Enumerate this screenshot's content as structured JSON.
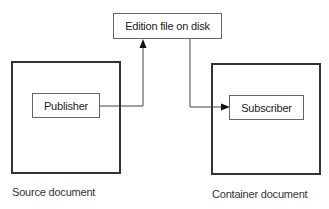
{
  "diagram": {
    "type": "publish-subscribe flow",
    "nodes": {
      "edition": {
        "label": "Edition file on disk"
      },
      "publisher": {
        "label": "Publisher"
      },
      "subscriber": {
        "label": "Subscriber"
      },
      "source_document": {
        "label": "Source document"
      },
      "container_document": {
        "label": "Container document"
      }
    },
    "edges": [
      {
        "from": "Publisher",
        "to": "Edition file on disk",
        "arrow": "end"
      },
      {
        "from": "Edition file on disk",
        "to": "Subscriber",
        "arrow": "end"
      }
    ],
    "colors": {
      "line": "#444444",
      "border": "#333333",
      "background": "#ffffff"
    }
  }
}
